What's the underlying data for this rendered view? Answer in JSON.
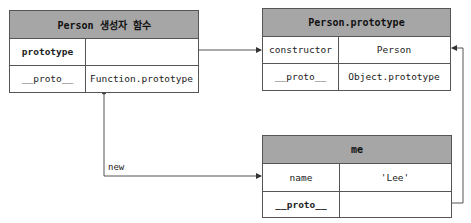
{
  "boxes": {
    "person_constructor": {
      "title": "Person 생성자 함수",
      "rows": [
        {
          "key": "prototype",
          "value": ""
        },
        {
          "key": "__proto__",
          "value": "Function.prototype"
        }
      ]
    },
    "person_prototype": {
      "title": "Person.prototype",
      "rows": [
        {
          "key": "constructor",
          "value": "Person"
        },
        {
          "key": "__proto__",
          "value": "Object.prototype"
        }
      ]
    },
    "me": {
      "title": "me",
      "rows": [
        {
          "key": "name",
          "value": "'Lee'"
        },
        {
          "key": "__proto__",
          "value": ""
        }
      ]
    }
  },
  "edges": [
    {
      "from": "Person.prototype (property)",
      "to": "Person.prototype (object)",
      "label": ""
    },
    {
      "from": "Person.prototype.constructor",
      "to": "Person (constructor)",
      "label": ""
    },
    {
      "from": "Person constructor",
      "to": "me",
      "label": "new"
    },
    {
      "from": "me.__proto__",
      "to": "Person.prototype",
      "label": ""
    }
  ],
  "labels": {
    "new": "new"
  },
  "colors": {
    "header_fill": "#a6a6a6",
    "border": "#555555",
    "line": "#444444"
  }
}
